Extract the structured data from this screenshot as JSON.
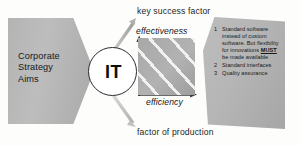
{
  "diagram": {
    "strategy_shape": {
      "label": "Corporate\nStrategy\nAims",
      "line1": "Corporate",
      "line2": "Strategy",
      "line3": "Aims",
      "fill_color": "#b4b4b4"
    },
    "it_node": {
      "label": "IT",
      "border_color": "#2b2b2b",
      "fill_color": "#ffffff"
    },
    "labels": {
      "top": "key success factor",
      "bottom": "factor of production"
    },
    "chart": {
      "y_axis_label": "effectiveness",
      "x_axis_label": "efficiency",
      "fill_color": "#a8a8a8",
      "arrow_color": "#111111"
    },
    "arrows": {
      "up_right": "arrow-up-right",
      "down_right": "arrow-down-right",
      "color": "#b9b9b9"
    },
    "requirements_shape": {
      "fill_color": "#b5b5b5",
      "items": [
        {
          "number": "1",
          "segments": [
            {
              "text": "Standard software instead of custom software. ",
              "emphasis": false
            },
            {
              "text": "But flexibility for innovations ",
              "emphasis": false
            },
            {
              "text": "MUST",
              "emphasis": true
            },
            {
              "text": " be made available",
              "emphasis": false
            }
          ],
          "plain": "Standard software instead of custom software. But flexibility for innovations MUST be made available"
        },
        {
          "number": "2",
          "segments": [
            {
              "text": "Standard interfaces",
              "emphasis": false
            }
          ],
          "plain": "Standard interfaces"
        },
        {
          "number": "3",
          "segments": [
            {
              "text": "Quality assurance",
              "emphasis": false
            }
          ],
          "plain": "Quality assurance"
        }
      ]
    }
  }
}
